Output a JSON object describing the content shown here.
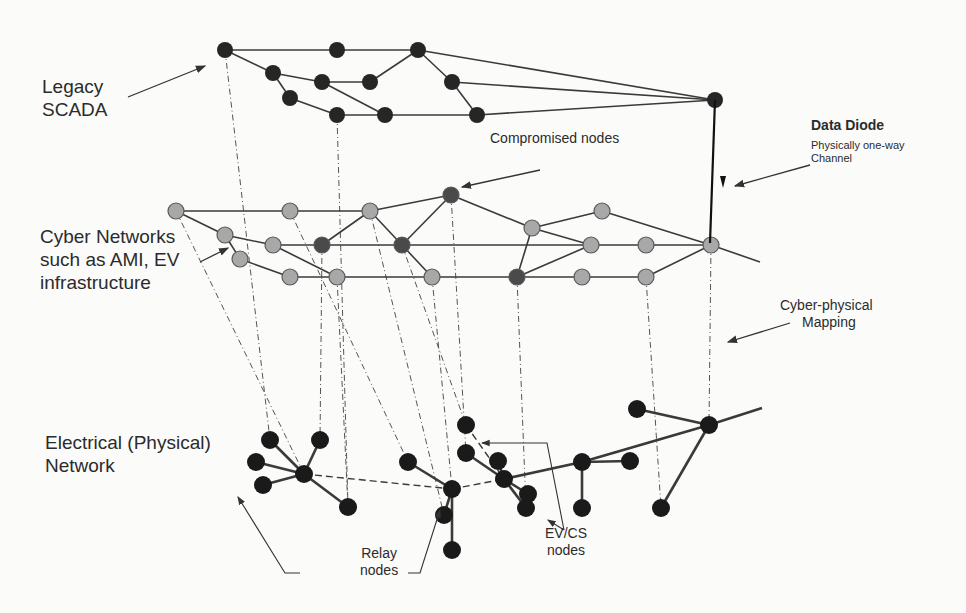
{
  "labels": {
    "legacy_scada": [
      "Legacy",
      "SCADA"
    ],
    "cyber_networks": [
      "Cyber Networks",
      "such as AMI, EV",
      "infrastructure"
    ],
    "electrical_network": [
      "Electrical (Physical)",
      "Network"
    ],
    "compromised_nodes": "Compromised nodes",
    "data_diode_title": "Data Diode",
    "data_diode_sub": [
      "Physically one-way",
      "Channel"
    ],
    "cyber_physical_mapping": [
      "Cyber-physical",
      "Mapping"
    ],
    "relay_nodes": [
      "Relay",
      "nodes"
    ],
    "evcs_nodes": [
      "EV/CS",
      "nodes"
    ]
  },
  "colors": {
    "scada_node": "#262626",
    "cyber_node": "#a8a8a8",
    "compromised_node": "#4a4a4a",
    "physical_node": "#1a1a1a",
    "edge": "#3a3a3a",
    "mapping_line": "#555555"
  },
  "scada": {
    "nodes": [
      [
        225,
        50
      ],
      [
        337,
        50
      ],
      [
        418,
        50
      ],
      [
        273,
        73
      ],
      [
        322,
        82
      ],
      [
        370,
        82
      ],
      [
        290,
        98
      ],
      [
        337,
        115
      ],
      [
        385,
        115
      ],
      [
        452,
        82
      ],
      [
        477,
        115
      ],
      [
        715,
        100
      ]
    ],
    "edges": [
      [
        0,
        1
      ],
      [
        1,
        2
      ],
      [
        0,
        3
      ],
      [
        3,
        4
      ],
      [
        4,
        5
      ],
      [
        5,
        2
      ],
      [
        2,
        9
      ],
      [
        3,
        6
      ],
      [
        6,
        7
      ],
      [
        7,
        8
      ],
      [
        4,
        8
      ],
      [
        9,
        10
      ],
      [
        8,
        10
      ],
      [
        2,
        11
      ],
      [
        9,
        11
      ],
      [
        10,
        11
      ]
    ]
  },
  "cyber": {
    "nodes": [
      [
        176,
        211
      ],
      [
        290,
        211
      ],
      [
        370,
        211
      ],
      [
        451,
        195
      ],
      [
        225,
        235
      ],
      [
        273,
        245
      ],
      [
        322,
        245
      ],
      [
        402,
        245
      ],
      [
        240,
        259
      ],
      [
        290,
        277
      ],
      [
        337,
        277
      ],
      [
        432,
        277
      ],
      [
        532,
        228
      ],
      [
        602,
        211
      ],
      [
        591,
        245
      ],
      [
        646,
        245
      ],
      [
        517,
        277
      ],
      [
        582,
        277
      ],
      [
        646,
        277
      ],
      [
        711,
        245
      ]
    ],
    "compromised": [
      3,
      6,
      7,
      16
    ],
    "edges": [
      [
        0,
        1
      ],
      [
        1,
        2
      ],
      [
        2,
        3
      ],
      [
        0,
        4
      ],
      [
        4,
        5
      ],
      [
        5,
        6
      ],
      [
        6,
        7
      ],
      [
        7,
        14
      ],
      [
        4,
        8
      ],
      [
        8,
        9
      ],
      [
        9,
        10
      ],
      [
        10,
        11
      ],
      [
        11,
        16
      ],
      [
        16,
        17
      ],
      [
        17,
        18
      ],
      [
        18,
        19
      ],
      [
        5,
        10
      ],
      [
        6,
        2
      ],
      [
        2,
        7
      ],
      [
        7,
        11
      ],
      [
        3,
        7
      ],
      [
        3,
        12
      ],
      [
        12,
        13
      ],
      [
        12,
        14
      ],
      [
        12,
        16
      ],
      [
        16,
        14
      ],
      [
        14,
        15
      ],
      [
        15,
        19
      ],
      [
        13,
        19
      ],
      [
        19,
        [
          760,
          262
        ]
      ]
    ]
  },
  "physical": {
    "nodes": [
      [
        270,
        440
      ],
      [
        320,
        440
      ],
      [
        256,
        462
      ],
      [
        304,
        474
      ],
      [
        263,
        485
      ],
      [
        348,
        507
      ],
      [
        452,
        489
      ],
      [
        408,
        462
      ],
      [
        444,
        515
      ],
      [
        452,
        550
      ],
      [
        466,
        425
      ],
      [
        466,
        453
      ],
      [
        498,
        461
      ],
      [
        504,
        479
      ],
      [
        526,
        508
      ],
      [
        528,
        494
      ],
      [
        582,
        462
      ],
      [
        630,
        461
      ],
      [
        582,
        508
      ],
      [
        709,
        425
      ],
      [
        637,
        409
      ],
      [
        661,
        508
      ]
    ],
    "edges": [
      [
        0,
        3
      ],
      [
        1,
        3
      ],
      [
        2,
        3
      ],
      [
        4,
        3
      ],
      [
        3,
        5
      ],
      [
        7,
        6
      ],
      [
        6,
        8
      ],
      [
        6,
        9
      ],
      [
        11,
        13
      ],
      [
        13,
        15
      ],
      [
        12,
        13
      ],
      [
        13,
        14
      ],
      [
        13,
        16
      ],
      [
        16,
        17
      ],
      [
        16,
        18
      ],
      [
        16,
        19
      ],
      [
        19,
        20
      ],
      [
        19,
        21
      ],
      [
        19,
        [
          762,
          408
        ]
      ]
    ],
    "dashed_edges": [
      [
        3,
        6
      ],
      [
        6,
        13
      ],
      [
        10,
        13
      ],
      [
        13,
        12
      ],
      [
        16,
        19
      ]
    ]
  },
  "mapping_lines": [
    [
      [
        225,
        50
      ],
      [
        270,
        440
      ]
    ],
    [
      [
        337,
        115
      ],
      [
        348,
        507
      ]
    ],
    [
      [
        176,
        211
      ],
      [
        304,
        474
      ]
    ],
    [
      [
        290,
        211
      ],
      [
        408,
        462
      ]
    ],
    [
      [
        322,
        245
      ],
      [
        320,
        440
      ]
    ],
    [
      [
        337,
        277
      ],
      [
        348,
        507
      ]
    ],
    [
      [
        370,
        211
      ],
      [
        444,
        515
      ]
    ],
    [
      [
        402,
        245
      ],
      [
        466,
        425
      ]
    ],
    [
      [
        451,
        195
      ],
      [
        466,
        453
      ]
    ],
    [
      [
        517,
        277
      ],
      [
        526,
        508
      ]
    ],
    [
      [
        646,
        277
      ],
      [
        661,
        508
      ]
    ],
    [
      [
        711,
        245
      ],
      [
        709,
        425
      ]
    ],
    [
      [
        432,
        277
      ],
      [
        452,
        489
      ]
    ]
  ]
}
